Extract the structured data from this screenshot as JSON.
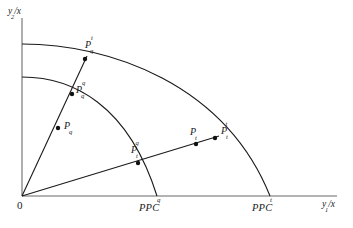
{
  "figure": {
    "type": "economics-ppc-diagram",
    "background_color": "#ffffff",
    "line_color": "#1a1a1a",
    "axis_color": "#8a8a8a"
  },
  "axes": {
    "origin_label": "0",
    "y_axis": {
      "label_base": "y",
      "label_sub": "2",
      "label_slash": "/x"
    },
    "x_axis": {
      "label_base": "y",
      "label_sub": "1",
      "label_slash": "/x"
    }
  },
  "curves": [
    {
      "name": "inner-ppc",
      "label_base": "PPC",
      "label_sup": "q",
      "x_intercept_label_x": 157,
      "x_intercept_label_y": 196
    },
    {
      "name": "outer-ppc",
      "label_base": "PPC",
      "label_sup": "t",
      "x_intercept_label_x": 270,
      "x_intercept_label_y": 196
    }
  ],
  "rays": [
    {
      "name": "ray-q",
      "description": "steep ray from origin through q-points"
    },
    {
      "name": "ray-t",
      "description": "flatter ray from origin through t-points"
    }
  ],
  "points": [
    {
      "id": "P_q",
      "base": "P",
      "sub": "q",
      "sup": "",
      "x": 58,
      "y": 128,
      "label_x": 64,
      "label_y": 120
    },
    {
      "id": "P_q_q",
      "base": "P",
      "sub": "q",
      "sup": "q",
      "x": 72,
      "y": 94,
      "label_x": 76,
      "label_y": 84
    },
    {
      "id": "P_q_t",
      "base": "P",
      "sub": "q",
      "sup": "t",
      "x": 85,
      "y": 59,
      "label_x": 85,
      "label_y": 40
    },
    {
      "id": "P_t_q",
      "base": "P",
      "sub": "t",
      "sup": "q",
      "x": 138,
      "y": 163,
      "label_x": 133,
      "label_y": 145
    },
    {
      "id": "P_t",
      "base": "P",
      "sub": "t",
      "sup": "",
      "x": 196,
      "y": 144,
      "label_x": 191,
      "label_y": 127
    },
    {
      "id": "P_t_t",
      "base": "P",
      "sub": "t",
      "sup": "t",
      "x": 215,
      "y": 138,
      "label_x": 222,
      "label_y": 126
    }
  ]
}
